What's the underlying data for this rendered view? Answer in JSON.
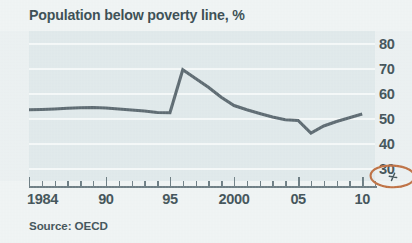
{
  "chart_data": {
    "type": "line",
    "title": "Population below poverty line, %",
    "xlabel": "",
    "ylabel": "",
    "source": "Source: OECD",
    "grid": true,
    "legend": "none",
    "xlim": [
      1984,
      2011
    ],
    "ylim": [
      25,
      85
    ],
    "y_ticks": [
      80,
      70,
      60,
      50,
      40,
      30
    ],
    "y_tick_labels": [
      "80",
      "70",
      "60",
      "50",
      "40",
      "30"
    ],
    "x_ticks": [
      1984,
      1990,
      1995,
      2000,
      2005,
      2010
    ],
    "x_tick_labels": [
      "1984",
      "90",
      "95",
      "2000",
      "05",
      "10"
    ],
    "x_minor_ticks": [
      1985,
      1986,
      1987,
      1988,
      1989,
      1991,
      1992,
      1993,
      1994,
      1996,
      1997,
      1998,
      1999,
      2001,
      2002,
      2003,
      2004,
      2006,
      2007,
      2008,
      2009,
      2011
    ],
    "y_axis_break": true,
    "x": [
      1984,
      1985,
      1986,
      1987,
      1988,
      1989,
      1990,
      1991,
      1992,
      1993,
      1994,
      1995,
      1996,
      1997,
      1998,
      1999,
      2000,
      2001,
      2002,
      2003,
      2004,
      2005,
      2006,
      2007,
      2008,
      2009,
      2010
    ],
    "values": [
      53.5,
      53.6,
      53.8,
      54.1,
      54.3,
      54.4,
      54.2,
      53.8,
      53.4,
      53.0,
      52.4,
      52.3,
      69.5,
      66.0,
      62.5,
      58.5,
      55.2,
      53.5,
      52.0,
      50.6,
      49.5,
      49.2,
      44.2,
      47.0,
      48.8,
      50.3,
      51.8
    ],
    "annotations": [
      {
        "kind": "hand-drawn-ellipse",
        "color": "#b8622f",
        "target": "y-axis-break-mark",
        "description": "Orange hand-drawn ellipse circling the axis-break zigzag near the lower right of the y axis"
      }
    ],
    "colors": {
      "line": "#4c5b63",
      "plot_background": "#dde7e9",
      "page_background": "#eef3f3",
      "gridline": "#f4f8f8",
      "text": "#2d4147",
      "axis": "#5e7077",
      "annotation": "#b8622f"
    }
  }
}
